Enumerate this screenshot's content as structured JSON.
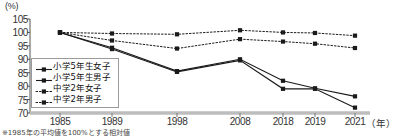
{
  "chart_data": {
    "type": "line",
    "title": "",
    "xlabel": "年",
    "ylabel": "(%)",
    "ylim": [
      70,
      105
    ],
    "yticks": [
      70,
      75,
      80,
      85,
      90,
      95,
      100,
      105
    ],
    "categories": [
      "1985",
      "1989",
      "1998",
      "2008",
      "2018",
      "2019",
      "2021"
    ],
    "grid": false,
    "legend_position": "inside-lower-left",
    "footnote": "※1985年の平均値を100%とする相対値",
    "series": [
      {
        "name": "小学5年生女子",
        "style": "solid",
        "marker": "square",
        "values": [
          100,
          94.3,
          85.6,
          90.0,
          82.0,
          79.2,
          76.2
        ]
      },
      {
        "name": "小学5年生男子",
        "style": "solid",
        "marker": "square",
        "values": [
          100,
          93.8,
          85.3,
          89.6,
          79.0,
          79.0,
          72.0
        ]
      },
      {
        "name": "中学2年女子",
        "style": "dotted",
        "marker": "square",
        "values": [
          100,
          97.0,
          94.0,
          97.5,
          96.6,
          95.8,
          94.2
        ]
      },
      {
        "name": "中学2年男子",
        "style": "dotted",
        "marker": "square",
        "values": [
          100,
          99.6,
          99.3,
          100.8,
          100.0,
          99.8,
          98.8
        ]
      }
    ]
  }
}
